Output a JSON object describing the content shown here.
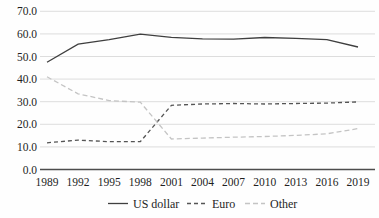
{
  "chart_data": {
    "type": "line",
    "title": "",
    "xlabel": "",
    "ylabel": "",
    "x": [
      1989,
      1992,
      1995,
      1998,
      2001,
      2004,
      2007,
      2010,
      2013,
      2016,
      2019
    ],
    "x_tick_labels": [
      "1989",
      "1992",
      "1995",
      "1998",
      "2001",
      "2004",
      "2007",
      "2010",
      "2013",
      "2016",
      "2019"
    ],
    "y_tick_labels": [
      "0.0",
      "10.0",
      "20.0",
      "30.0",
      "40.0",
      "50.0",
      "60.0",
      "70.0"
    ],
    "ylim": [
      0,
      70
    ],
    "ytick_step": 10,
    "grid": "horizontal",
    "legend_position": "bottom",
    "series": [
      {
        "name": "US dollar",
        "color": "#3f3f3f",
        "line_style": "solid",
        "dash": "",
        "values": [
          47.5,
          55.5,
          57.5,
          59.9,
          58.5,
          57.8,
          57.7,
          58.4,
          58.0,
          57.5,
          54.2
        ]
      },
      {
        "name": "Euro",
        "color": "#555555",
        "line_style": "dashed",
        "dash": "4 3",
        "values": [
          11.8,
          13.0,
          12.3,
          12.3,
          28.4,
          29.0,
          29.2,
          29.0,
          29.2,
          29.4,
          29.9
        ]
      },
      {
        "name": "Other",
        "color": "#c4c4c4",
        "line_style": "dashed",
        "dash": "5 3",
        "values": [
          41.0,
          33.5,
          30.5,
          29.8,
          13.5,
          13.9,
          14.3,
          14.6,
          15.1,
          15.8,
          18.1
        ]
      }
    ],
    "colors": {
      "gridline": "#d9d9d9",
      "axis_line": "#4d4d4d",
      "text": "#1f1f1f",
      "background": "#ffffff"
    }
  }
}
